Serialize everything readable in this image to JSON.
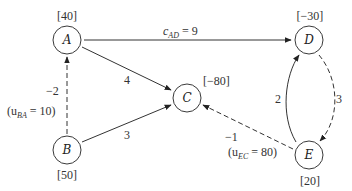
{
  "diagram": {
    "nodes": [
      {
        "id": "A",
        "label": "A",
        "supply": "[40]",
        "x": 67,
        "y": 40
      },
      {
        "id": "B",
        "label": "B",
        "supply": "[50]",
        "x": 67,
        "y": 150
      },
      {
        "id": "C",
        "label": "C",
        "supply": "[−80]",
        "x": 187,
        "y": 98
      },
      {
        "id": "D",
        "label": "D",
        "supply": "[−30]",
        "x": 309,
        "y": 40
      },
      {
        "id": "E",
        "label": "E",
        "supply": "[20]",
        "x": 309,
        "y": 155
      }
    ],
    "edges": [
      {
        "from": "A",
        "to": "D",
        "style": "solid",
        "label_prefix": "c",
        "label_sub": "AD",
        "label_value": " = 9"
      },
      {
        "from": "A",
        "to": "C",
        "style": "solid",
        "label": "4"
      },
      {
        "from": "B",
        "to": "C",
        "style": "solid",
        "label": "3"
      },
      {
        "from": "B",
        "to": "A",
        "style": "dashed",
        "label": "−2",
        "capacity_prefix": "(u",
        "capacity_sub": "BA",
        "capacity_value": " = 10)"
      },
      {
        "from": "E",
        "to": "D",
        "style": "solid",
        "label": "2"
      },
      {
        "from": "D",
        "to": "E",
        "style": "dashed",
        "label": "3"
      },
      {
        "from": "E",
        "to": "C",
        "style": "dashed",
        "label": "−1",
        "capacity_prefix": "(u",
        "capacity_sub": "EC",
        "capacity_value": " = 80)"
      }
    ]
  }
}
